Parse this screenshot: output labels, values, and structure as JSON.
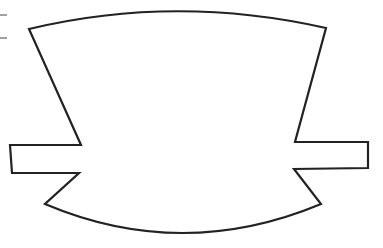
{
  "figure": {
    "stroke_color": "#222222",
    "fill_color": "#ffffff",
    "background": "#ffffff"
  }
}
